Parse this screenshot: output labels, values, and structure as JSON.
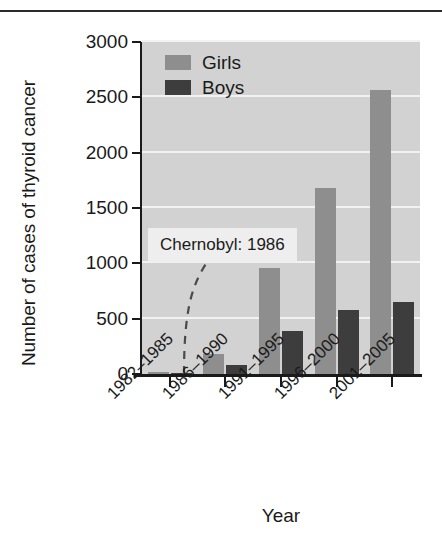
{
  "chart_data": {
    "type": "bar",
    "title": "",
    "xlabel": "Year",
    "ylabel": "Number of cases of thyroid cancer",
    "categories": [
      "1982–1985",
      "1986–1990",
      "1991–1995",
      "1996–2000",
      "2001–2005"
    ],
    "series": [
      {
        "name": "Girls",
        "color": "#8e8e8e",
        "values": [
          20,
          180,
          960,
          1680,
          2570
        ]
      },
      {
        "name": "Boys",
        "color": "#3d3d3d",
        "values": [
          10,
          80,
          390,
          580,
          650
        ]
      }
    ],
    "ylim": [
      0,
      3000
    ],
    "yticks": [
      0,
      500,
      1000,
      1500,
      2000,
      2500,
      3000
    ],
    "ytick_labels": [
      "0",
      "500",
      "1000",
      "1500",
      "2000",
      "2500",
      "3000"
    ],
    "grid": true,
    "grid_color": "#f2f2f2",
    "plot_background": "#d2d2d2",
    "legend_position": "top-left",
    "annotations": [
      {
        "text": "Chernobyl: 1986",
        "value_x": "1986–1990",
        "style": "dashed-curve-callout"
      }
    ]
  },
  "legend": {
    "items": [
      {
        "label": "Girls",
        "color": "#8e8e8e"
      },
      {
        "label": "Boys",
        "color": "#3d3d3d"
      }
    ]
  },
  "axes": {
    "y_title": "Number of cases of thyroid cancer",
    "x_title": "Year"
  },
  "annotation": {
    "label": "Chernobyl: 1986"
  }
}
